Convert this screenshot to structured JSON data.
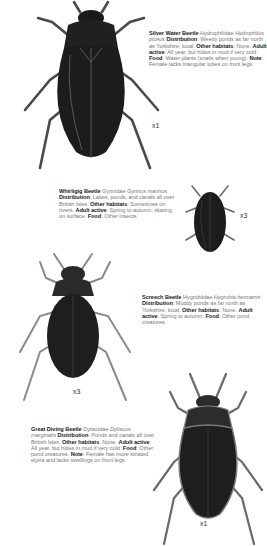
{
  "entries": [
    {
      "name": "Silver Water Beetle",
      "family": "Hydrophilidae",
      "latin": "Hydrophilus piceus",
      "distribution_label": "Distribution",
      "distribution": "Weedy ponds as far north as Yorkshire; local.",
      "other_habitats_label": "Other habitats",
      "other_habitats": "None.",
      "adult_active_label": "Adult active",
      "adult_active": "All year, but hides in mud if very cold.",
      "food_label": "Food",
      "food": "Water plants (snails when young).",
      "note_label": "Note",
      "note": "Female lacks triangular lobes on front legs.",
      "scale": "x1"
    },
    {
      "name": "Whirligig Beetle",
      "family": "Gyrinidae",
      "latin": "Gyrinus marinus",
      "distribution_label": "Distribution",
      "distribution": "Lakes, ponds, and canals all over British Isles.",
      "other_habitats_label": "Other habitats",
      "other_habitats": "Sometimes on rivers.",
      "adult_active_label": "Adult active",
      "adult_active": "Spring to autumn, skating on surface.",
      "food_label": "Food",
      "food": "Other insects.",
      "scale": "x3"
    },
    {
      "name": "Screech Beetle",
      "family": "Hygrobiidae",
      "latin": "Hygrobia hermanni",
      "distribution_label": "Distribution",
      "distribution": "Muddy ponds as far north as Yorkshire; local.",
      "other_habitats_label": "Other habitats",
      "other_habitats": "None.",
      "adult_active_label": "Adult active",
      "adult_active": "Spring to autumn.",
      "food_label": "Food",
      "food": "Other pond creatures.",
      "scale": "x3"
    },
    {
      "name": "Great Diving Beetle",
      "family": "Dytiscidae",
      "latin": "Dytiscus marginalis",
      "distribution_label": "Distribution",
      "distribution": "Ponds and canals all over British Isles.",
      "other_habitats_label": "Other habitats",
      "other_habitats": "None.",
      "adult_active_label": "Adult active",
      "adult_active": "All year, but hides in mud if very cold.",
      "food_label": "Food",
      "food": "Other pond creatures.",
      "note_label": "Note",
      "note": "Female has more striated elytra and lacks swellings on front legs.",
      "scale": "x1"
    }
  ],
  "colors": {
    "beetle_dark": "#1c1c1e",
    "beetle_mid": "#3a3a3c",
    "leg": "#5a5a5c",
    "text_bold": "#222222",
    "text_light": "#777777"
  }
}
